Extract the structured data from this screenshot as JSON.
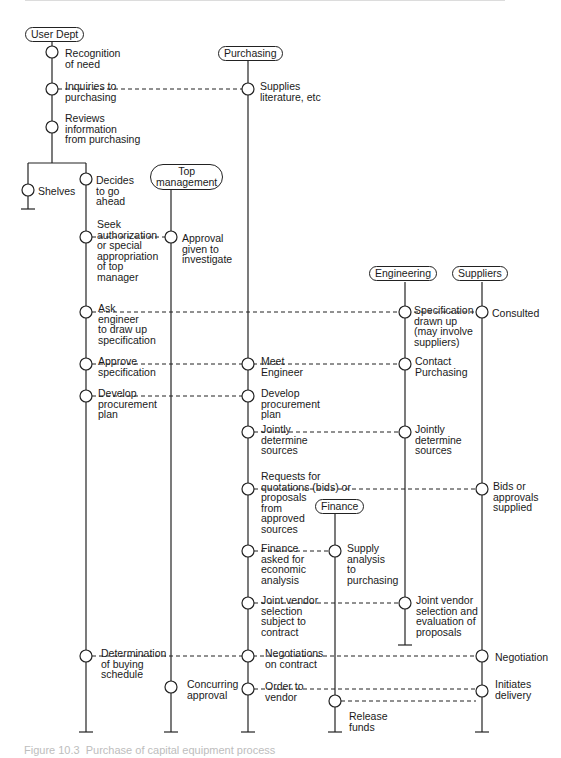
{
  "lanes": {
    "user_dept": "User Dept",
    "purchasing": "Purchasing",
    "top_management": "Top\nmanagement",
    "engineering": "Engineering",
    "suppliers": "Suppliers",
    "finance": "Finance"
  },
  "steps": {
    "recognition": "Recognition\nof need",
    "inquiries": "Inquiries to\npurchasing",
    "supplies_literature": "Supplies\nliterature, etc",
    "reviews": "Reviews\ninformation\nfrom purchasing",
    "shelves": "Shelves",
    "decides": "Decides\nto go\nahead",
    "seek_authorization": "Seek\nauthorization\nor special\nappropriation\nof top\nmanager",
    "approval_given": "Approval\ngiven to\ninvestigate",
    "ask_engineer": "Ask\nengineer\nto draw up\nspecification",
    "specification_drawn": "Specification\ndrawn up\n(may involve\nsuppliers)",
    "consulted": "Consulted",
    "approve_spec": "Approve\nspecification",
    "meet_engineer": "Meet\nEngineer",
    "contact_purchasing": "Contact\nPurchasing",
    "develop_plan_user": "Develop\nprocurement\nplan",
    "develop_plan_purch": "Develop\nprocurement\nplan",
    "jointly_purch": "Jointly\ndetermine\nsources",
    "jointly_eng": "Jointly\ndetermine\nsources",
    "requests_quotations": "Requests for\nquotations (bids) or\nproposals\nfrom\napproved\nsources",
    "bids_supplied": "Bids or\napprovals\nsupplied",
    "finance_asked": "Finance\nasked for\neconomic\nanalysis",
    "supply_analysis": "Supply\nanalysis\nto\npurchasing",
    "joint_vendor_purch": "Joint vendor\nselection\nsubject to\ncontract",
    "joint_vendor_eng": "Joint vendor\nselection and\nevaluation of\nproposals",
    "determination": "Determination\nof buying\nschedule",
    "negotiations": "Negotiations\non contract",
    "negotiation_supp": "Negotiation",
    "concurring": "Concurring\napproval",
    "order_vendor": "Order to\nvendor",
    "initiates_delivery": "Initiates\ndelivery",
    "release_funds": "Release\nfunds"
  },
  "caption": "Figure 10.3  Purchase of capital equipment process"
}
